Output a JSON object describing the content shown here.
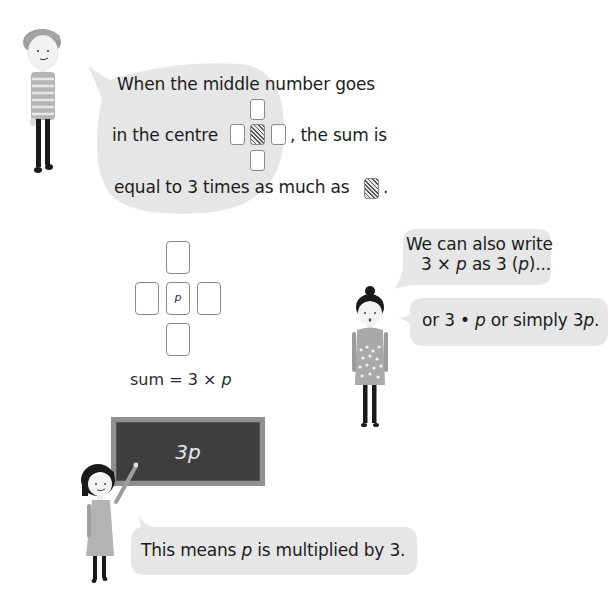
{
  "bubble_top": {
    "line1": "When the middle number goes",
    "line2_before": "in the centre",
    "line2_after": ", the sum is",
    "line3_before": "equal to 3 times as much as",
    "line3_after": "."
  },
  "card_diagram": {
    "center_label": "p",
    "caption_prefix": "sum = 3 × ",
    "caption_var": "p"
  },
  "bubble_right_1": {
    "line1": "We can also write",
    "line2_a": "3 × ",
    "line2_var": "p",
    "line2_b": " as 3 (",
    "line2_var2": "p",
    "line2_c": ")..."
  },
  "bubble_right_2": {
    "text_a": "or 3 • ",
    "var1": "p",
    "text_b": " or simply 3",
    "var2": "p",
    "text_c": "."
  },
  "blackboard": {
    "text": "3p"
  },
  "bubble_bottom": {
    "text_a": "This means ",
    "var": "p",
    "text_b": " is multiplied by 3."
  },
  "colors": {
    "bubble": "#e6e6e6",
    "blackboard": "#3e3e3e",
    "blackboard_frame": "#8f8f8f",
    "card_border": "#8a8a8a"
  }
}
